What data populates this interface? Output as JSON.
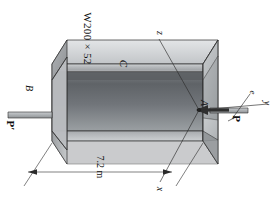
{
  "figure": {
    "orientation_note": "entire figure rotated 90 degrees clockwise",
    "background_color": "#ffffff",
    "line_color": "#1a1a1a"
  },
  "labels": {
    "section_designation": "W200 × 52",
    "point_c": "C",
    "point_b": "B",
    "point_a": "A",
    "force_p": "P",
    "force_p_prime": "P′",
    "eccentricity": "e",
    "axis_x": "x",
    "axis_y": "y",
    "axis_z": "z",
    "span_dimension": "7.2 m"
  },
  "colors": {
    "flange_top": "#b9bcbe",
    "flange_top_light": "#d6d8da",
    "web_face": "#9a9da0",
    "web_dark": "#6e7276",
    "end_face": "#c3c6c8",
    "end_face_dark": "#8d9194",
    "outline": "#2b2b2b",
    "shadow": "#7a7e81"
  },
  "geometry": {
    "span_label_value": 7.2,
    "span_units": "m",
    "section": "W200x52"
  }
}
